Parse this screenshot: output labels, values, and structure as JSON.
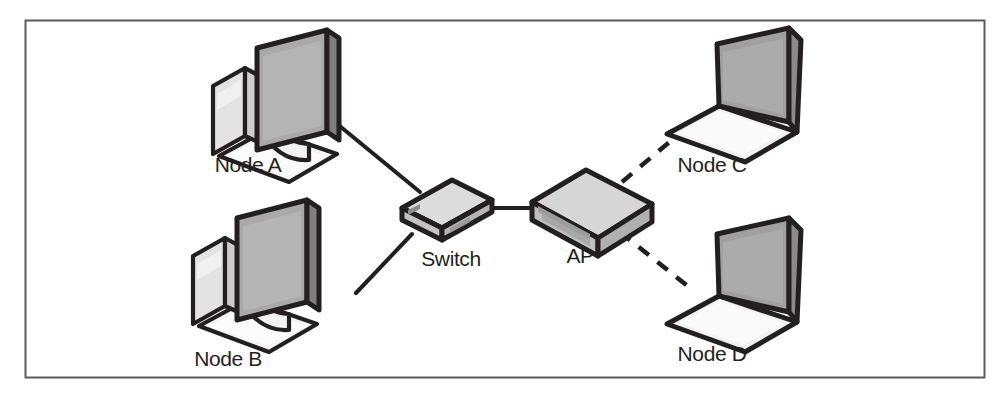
{
  "figure": {
    "border": {
      "visible": true,
      "color": "#5a5a5a",
      "x": 25,
      "y": 20,
      "width": 960,
      "height": 358
    },
    "background_color": "#ffffff"
  },
  "palette": {
    "outline": "#231f20",
    "screen_fill": "#a9a9a9",
    "screen_fill_dark": "#9b9b9b",
    "body_light": "#f2f2f2",
    "body_mid": "#d8d8d8",
    "body_shadow": "#c6c6c6",
    "device_top": "#d4d4d4",
    "device_front": "#bdbdbd",
    "device_side": "#cfcfcf",
    "link_color": "#231f20",
    "label_color": "#231f20"
  },
  "nodes": [
    {
      "id": "node-a",
      "label": "Node A",
      "type": "desktop-computer",
      "label_x": 122,
      "label_y": 165,
      "icon_x": 255,
      "icon_y": 30
    },
    {
      "id": "node-b",
      "label": "Node B",
      "type": "desktop-computer",
      "label_x": 105,
      "label_y": 364,
      "icon_x": 233,
      "icon_y": 228
    },
    {
      "id": "switch",
      "label": "Switch",
      "type": "network-switch",
      "label_x": 418,
      "label_y": 266,
      "icon_x": 398,
      "icon_y": 182
    },
    {
      "id": "ap",
      "label": "AP",
      "type": "access-point",
      "label_x": 565,
      "label_y": 263,
      "icon_x": 528,
      "icon_y": 172
    },
    {
      "id": "node-c",
      "label": "Node C",
      "type": "laptop",
      "label_x": 672,
      "label_y": 170,
      "icon_x": 660,
      "icon_y": 30
    },
    {
      "id": "node-d",
      "label": "Node D",
      "type": "laptop",
      "label_x": 672,
      "label_y": 359,
      "icon_x": 660,
      "icon_y": 228
    }
  ],
  "links": [
    {
      "id": "link-node-a-switch",
      "from": "node-a",
      "to": "switch",
      "style": "solid",
      "medium": "wired"
    },
    {
      "id": "link-node-b-switch",
      "from": "node-b",
      "to": "switch",
      "style": "solid",
      "medium": "wired"
    },
    {
      "id": "link-switch-ap",
      "from": "switch",
      "to": "ap",
      "style": "solid",
      "medium": "wired"
    },
    {
      "id": "link-ap-node-c",
      "from": "ap",
      "to": "node-c",
      "style": "dashed",
      "medium": "wireless"
    },
    {
      "id": "link-ap-node-d",
      "from": "ap",
      "to": "node-d",
      "style": "dashed",
      "medium": "wireless"
    }
  ]
}
